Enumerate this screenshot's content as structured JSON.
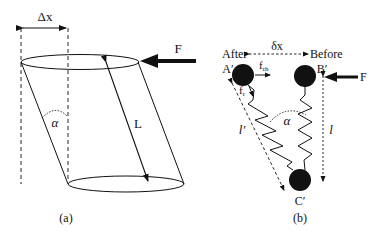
{
  "panel_a": {
    "caption": "(a)",
    "delta_label": "Δx",
    "angle_label": "α",
    "length_label": "L",
    "force_label": "F"
  },
  "panel_b": {
    "caption": "(b)",
    "after_label": "After",
    "before_label": "Before",
    "displacement_label": "δx",
    "node_a_label": "A′",
    "node_b_label": "B′",
    "node_c_label": "C′",
    "force_rh_base": "f",
    "force_rh_sub": "rh",
    "force_r_base": "f",
    "force_r_sub": "r",
    "angle_label": "α",
    "length_after_label": "l′",
    "length_before_label": "l",
    "force_label": "F"
  },
  "colors": {
    "ink": "#111111",
    "background": "#ffffff"
  }
}
